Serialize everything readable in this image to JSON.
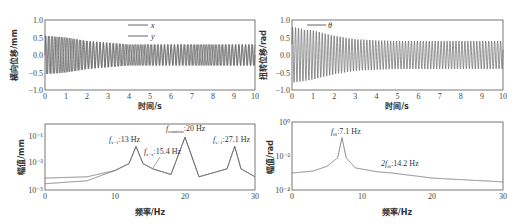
{
  "chart_data": [
    {
      "id": "top-left",
      "type": "line",
      "title": "",
      "xlabel": "时间/s",
      "ylabel": "横向位移/mm",
      "xlim": [
        0,
        10
      ],
      "ylim": [
        -1.0,
        1.0
      ],
      "xticks": [
        "0",
        "1",
        "2",
        "3",
        "4",
        "5",
        "6",
        "7",
        "8",
        "9",
        "10"
      ],
      "yticks": [
        "−1.0",
        "−0.5",
        "0.0",
        "0.5",
        "1.0"
      ],
      "grid": false,
      "legend": {
        "position": "upper-center",
        "entries": [
          "x",
          "y"
        ]
      },
      "series": [
        {
          "name": "x",
          "description": "decaying oscillation; amplitude ~0.55 at t=0 decaying to ~0.3 steady"
        },
        {
          "name": "y",
          "description": "decaying oscillation; amplitude ~0.55 at t=0 decaying to ~0.3 steady"
        }
      ],
      "envelope": {
        "t": [
          0,
          1,
          2,
          3,
          4,
          5,
          6,
          7,
          8,
          9,
          10
        ],
        "amplitude": [
          0.55,
          0.5,
          0.4,
          0.35,
          0.3,
          0.3,
          0.3,
          0.3,
          0.3,
          0.3,
          0.3
        ]
      }
    },
    {
      "id": "top-right",
      "type": "line",
      "title": "",
      "xlabel": "时间/s",
      "ylabel": "扭转位移/rad",
      "xlim": [
        0,
        10
      ],
      "ylim": [
        -1.0,
        1.0
      ],
      "xticks": [
        "0",
        "1",
        "2",
        "3",
        "4",
        "5",
        "6",
        "7",
        "8",
        "9",
        "10"
      ],
      "yticks": [
        "−1.0",
        "−0.5",
        "0.0",
        "0.5",
        "1.0"
      ],
      "grid": false,
      "legend": {
        "position": "upper-left",
        "entries": [
          "θ"
        ]
      },
      "series": [
        {
          "name": "θ",
          "description": "decaying oscillation; peak ~0.8 near t=0.2, settling to ~±0.4"
        }
      ],
      "envelope": {
        "t": [
          0,
          0.5,
          1,
          2,
          3,
          4,
          5,
          6,
          7,
          8,
          9,
          10
        ],
        "amplitude": [
          0.8,
          0.75,
          0.7,
          0.55,
          0.45,
          0.42,
          0.4,
          0.4,
          0.4,
          0.4,
          0.4,
          0.4
        ]
      }
    },
    {
      "id": "bottom-left",
      "type": "line",
      "title": "",
      "xlabel": "频率/Hz",
      "ylabel": "幅值/mm",
      "xlim": [
        0,
        30
      ],
      "yscale": "log",
      "ylim": [
        1e-05,
        1
      ],
      "xticks": [
        "0",
        "10",
        "20",
        "30"
      ],
      "yticks": [
        "10⁻⁵",
        "10⁻³",
        "10⁻¹"
      ],
      "grid": false,
      "annotations": [
        {
          "text": "f_{s-1}:13 Hz",
          "x": 13
        },
        {
          "text": "f_{s+x}:15.4 Hz",
          "x": 15.4
        },
        {
          "text": "f_rotation:20 Hz",
          "x": 20
        },
        {
          "text": "f_{s+1}:27.1 Hz",
          "x": 27.1
        }
      ],
      "series": [
        {
          "name": "x",
          "x": [
            0,
            6,
            10,
            12,
            13,
            14,
            15.4,
            18,
            20,
            22,
            26,
            27.1,
            28,
            30
          ],
          "y": [
            8e-05,
            0.0001,
            0.0003,
            0.001,
            0.02,
            0.001,
            0.0004,
            0.00015,
            0.1,
            0.0001,
            0.0004,
            0.02,
            0.0004,
            0.0001
          ]
        },
        {
          "name": "y",
          "x": [
            0,
            6,
            10,
            12,
            13,
            14,
            15.4,
            18,
            20,
            22,
            26,
            27.1,
            28,
            30
          ],
          "y": [
            3e-05,
            5e-05,
            0.0003,
            0.001,
            0.02,
            0.001,
            0.0004,
            0.00015,
            0.1,
            0.0001,
            0.0004,
            0.02,
            0.0004,
            0.0001
          ]
        }
      ]
    },
    {
      "id": "bottom-right",
      "type": "line",
      "title": "",
      "xlabel": "频率/Hz",
      "ylabel": "幅值/rad",
      "xlim": [
        0,
        30
      ],
      "yscale": "log",
      "ylim": [
        0.0001,
        1
      ],
      "xticks": [
        "0",
        "10",
        "20",
        "30"
      ],
      "yticks": [
        "10⁻⁴",
        "10⁻²",
        "10⁰"
      ],
      "grid": false,
      "annotations": [
        {
          "text": "f_{t0}:7.1 Hz",
          "x": 7.1
        },
        {
          "text": "2f_{t0}:14.2 Hz",
          "x": 14.2
        }
      ],
      "series": [
        {
          "name": "θ",
          "x": [
            0,
            3,
            5,
            6.5,
            7.1,
            7.7,
            9,
            12,
            14.2,
            20,
            30
          ],
          "y": [
            0.001,
            0.0013,
            0.0025,
            0.008,
            0.12,
            0.008,
            0.002,
            0.0012,
            0.001,
            0.0005,
            0.0003
          ]
        }
      ]
    }
  ],
  "panels": {
    "tl": {
      "ylabel": "横向位移/mm",
      "xlabel": "时间/s",
      "legend_x": "x",
      "legend_y": "y",
      "yticks": [
        "1.0",
        "0.5",
        "0.0",
        "−0.5",
        "−1.0"
      ],
      "xticks": [
        "0",
        "1",
        "2",
        "3",
        "4",
        "5",
        "6",
        "7",
        "8",
        "9",
        "10"
      ]
    },
    "tr": {
      "ylabel": "扭转位移/rad",
      "xlabel": "时间/s",
      "legend_theta": "θ",
      "yticks": [
        "1.0",
        "0.5",
        "0.0",
        "−0.5",
        "−1.0"
      ],
      "xticks": [
        "0",
        "1",
        "2",
        "3",
        "4",
        "5",
        "6",
        "7",
        "8",
        "9",
        "10"
      ]
    },
    "bl": {
      "ylabel": "幅值/mm",
      "xlabel": "频率/Hz",
      "yticks": [
        "10⁻¹",
        "10⁻³",
        "10⁻⁵"
      ],
      "xticks": [
        "0",
        "10",
        "20",
        "30"
      ],
      "ann1": "f",
      "ann1sub": "s−1",
      "ann1val": ":13 Hz",
      "ann2": "f",
      "ann2sub": "s+x",
      "ann2val": ":15.4 Hz",
      "ann3": "f",
      "ann3sub": "rotation",
      "ann3val": ":20 Hz",
      "ann4": "f",
      "ann4sub": "s+1",
      "ann4val": ":27.1 Hz"
    },
    "br": {
      "ylabel": "幅值/rad",
      "xlabel": "频率/Hz",
      "yticks": [
        "10⁰",
        "10⁻²",
        "10⁻⁴"
      ],
      "xticks": [
        "0",
        "10",
        "20",
        "30"
      ],
      "ann1": "f",
      "ann1sub": "t0",
      "ann1val": ":7.1 Hz",
      "ann2": "2f",
      "ann2sub": "t0",
      "ann2val": ":14.2 Hz"
    }
  },
  "colors": {
    "line": "#666666",
    "axis": "#555555"
  }
}
